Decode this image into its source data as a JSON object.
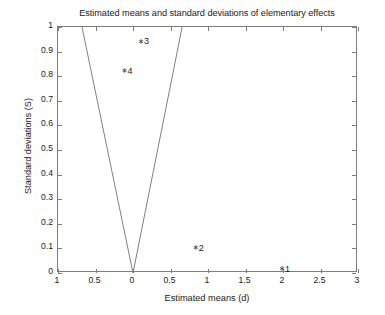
{
  "chart_data": {
    "type": "scatter",
    "title": "Estimated means and standard deviations of elementary effects",
    "xlabel": "Estimated means (d)",
    "ylabel": "Standard deviations (S)",
    "xlim": [
      -1,
      3
    ],
    "ylim": [
      0,
      1
    ],
    "grid": false,
    "legend": null,
    "xticks": [
      {
        "value": -1,
        "label": "1"
      },
      {
        "value": -0.5,
        "label": "0.5"
      },
      {
        "value": 0,
        "label": "0"
      },
      {
        "value": 0.5,
        "label": "0.5"
      },
      {
        "value": 1,
        "label": "1"
      },
      {
        "value": 1.5,
        "label": "1.5"
      },
      {
        "value": 2,
        "label": "2"
      },
      {
        "value": 2.5,
        "label": "2.5"
      },
      {
        "value": 3,
        "label": "3"
      }
    ],
    "yticks": [
      {
        "value": 0,
        "label": "0"
      },
      {
        "value": 0.1,
        "label": "0.1"
      },
      {
        "value": 0.2,
        "label": "0.2"
      },
      {
        "value": 0.3,
        "label": "0.3"
      },
      {
        "value": 0.4,
        "label": "0.4"
      },
      {
        "value": 0.5,
        "label": "0.5"
      },
      {
        "value": 0.6,
        "label": "0.6"
      },
      {
        "value": 0.7,
        "label": "0.7"
      },
      {
        "value": 0.8,
        "label": "0.8"
      },
      {
        "value": 0.9,
        "label": "0.9"
      },
      {
        "value": 1,
        "label": "1"
      }
    ],
    "marker_glyph": "*",
    "points": [
      {
        "label": "1",
        "x": 2.0,
        "y": 0.005
      },
      {
        "label": "2",
        "x": 0.85,
        "y": 0.09
      },
      {
        "label": "3",
        "x": 0.12,
        "y": 0.93
      },
      {
        "label": "4",
        "x": -0.1,
        "y": 0.81
      }
    ],
    "wedge_lines": [
      {
        "name": "left-wedge-line",
        "points": [
          {
            "x": 0,
            "y": 0
          },
          {
            "x": -0.68,
            "y": 1.0
          }
        ]
      },
      {
        "name": "right-wedge-line",
        "points": [
          {
            "x": 0,
            "y": 0
          },
          {
            "x": 0.655,
            "y": 1.0
          }
        ]
      }
    ],
    "colors": {
      "line": "#808080",
      "axis": "#7d7d7d",
      "text": "#1a1a1a",
      "background": "#ffffff"
    }
  }
}
